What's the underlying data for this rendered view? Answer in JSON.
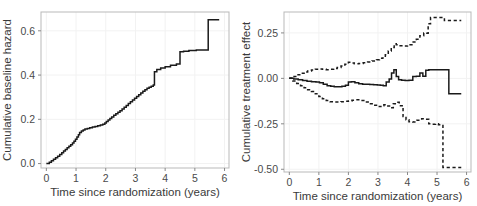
{
  "figure": {
    "panels": [
      "baseline-hazard",
      "treatment-effect"
    ],
    "line_color": "#1a1a1a",
    "grid_color": "#f2f2f2",
    "border_color": "#b9b9b9"
  },
  "chart_data": [
    {
      "type": "line",
      "id": "baseline-hazard",
      "title": "",
      "xlabel": "Time since randomization (years)",
      "ylabel": "Cumulative baseline hazard",
      "xlim": [
        -0.18,
        6.15
      ],
      "ylim": [
        -0.02,
        0.685
      ],
      "xticks": [
        0,
        1,
        2,
        3,
        4,
        5,
        6
      ],
      "xticklabels": [
        "0",
        "1",
        "2",
        "3",
        "4",
        "5",
        "6"
      ],
      "yticks": [
        0.0,
        0.2,
        0.4,
        0.6
      ],
      "yticklabels": [
        "0.0",
        "0.2",
        "0.4",
        "0.6"
      ],
      "grid": true,
      "legend": "none",
      "series": [
        {
          "name": "cumulative baseline hazard",
          "style": "step-solid",
          "x": [
            0.0,
            0.1,
            0.17,
            0.24,
            0.31,
            0.38,
            0.45,
            0.52,
            0.58,
            0.64,
            0.7,
            0.76,
            0.82,
            0.88,
            0.93,
            0.98,
            1.03,
            1.08,
            1.12,
            1.18,
            1.24,
            1.3,
            1.38,
            1.46,
            1.55,
            1.64,
            1.73,
            1.82,
            1.9,
            1.97,
            2.02,
            2.08,
            2.14,
            2.2,
            2.27,
            2.34,
            2.41,
            2.48,
            2.55,
            2.62,
            2.69,
            2.76,
            2.83,
            2.9,
            2.97,
            3.04,
            3.11,
            3.18,
            3.25,
            3.32,
            3.39,
            3.46,
            3.53,
            3.6,
            3.64,
            3.72,
            3.85,
            4.0,
            4.18,
            4.38,
            4.5,
            4.62,
            4.8,
            5.05,
            5.45,
            5.82
          ],
          "y": [
            0.0,
            0.006,
            0.013,
            0.019,
            0.026,
            0.033,
            0.041,
            0.049,
            0.057,
            0.064,
            0.071,
            0.078,
            0.085,
            0.093,
            0.101,
            0.11,
            0.12,
            0.13,
            0.14,
            0.147,
            0.152,
            0.156,
            0.159,
            0.162,
            0.165,
            0.168,
            0.171,
            0.174,
            0.178,
            0.183,
            0.19,
            0.197,
            0.204,
            0.211,
            0.218,
            0.225,
            0.232,
            0.239,
            0.247,
            0.255,
            0.263,
            0.271,
            0.279,
            0.287,
            0.295,
            0.303,
            0.311,
            0.319,
            0.327,
            0.334,
            0.34,
            0.345,
            0.35,
            0.355,
            0.415,
            0.425,
            0.432,
            0.438,
            0.444,
            0.45,
            0.505,
            0.508,
            0.511,
            0.513,
            0.65,
            0.65
          ]
        }
      ]
    },
    {
      "type": "line",
      "id": "treatment-effect",
      "title": "",
      "xlabel": "Time since randomization (years)",
      "ylabel": "Cumulative treatment effect",
      "xlim": [
        -0.18,
        6.15
      ],
      "ylim": [
        -0.515,
        0.365
      ],
      "xticks": [
        0,
        1,
        2,
        3,
        4,
        5,
        6
      ],
      "xticklabels": [
        "0",
        "1",
        "2",
        "3",
        "4",
        "5",
        "6"
      ],
      "yticks": [
        0.25,
        0.0,
        -0.25,
        -0.5
      ],
      "yticklabels": [
        "0.25",
        "0.00",
        "-0.25",
        "-0.50"
      ],
      "grid": true,
      "legend": "none",
      "series": [
        {
          "name": "upper confidence limit",
          "style": "step-dashed",
          "x": [
            0.0,
            0.12,
            0.25,
            0.38,
            0.5,
            0.62,
            0.75,
            0.88,
            1.0,
            1.12,
            1.25,
            1.38,
            1.5,
            1.62,
            1.75,
            1.88,
            2.0,
            2.1,
            2.2,
            2.35,
            2.5,
            2.65,
            2.8,
            2.95,
            3.05,
            3.15,
            3.25,
            3.35,
            3.45,
            3.55,
            3.62,
            3.7,
            3.85,
            4.0,
            4.15,
            4.3,
            4.42,
            4.55,
            4.62,
            4.7,
            4.78,
            4.9,
            5.05,
            5.25,
            5.5,
            5.82
          ],
          "y": [
            0.0,
            0.01,
            0.02,
            0.028,
            0.035,
            0.04,
            0.046,
            0.05,
            0.052,
            0.05,
            0.048,
            0.05,
            0.054,
            0.06,
            0.068,
            0.078,
            0.088,
            0.085,
            0.08,
            0.082,
            0.086,
            0.09,
            0.096,
            0.103,
            0.11,
            0.112,
            0.13,
            0.15,
            0.17,
            0.19,
            0.185,
            0.18,
            0.178,
            0.185,
            0.2,
            0.215,
            0.235,
            0.25,
            0.248,
            0.3,
            0.335,
            0.335,
            0.335,
            0.318,
            0.318,
            0.318
          ]
        },
        {
          "name": "cumulative treatment effect",
          "style": "step-solid",
          "x": [
            0.0,
            0.15,
            0.3,
            0.45,
            0.6,
            0.75,
            0.9,
            1.02,
            1.15,
            1.28,
            1.4,
            1.52,
            1.65,
            1.78,
            1.9,
            2.0,
            2.1,
            2.22,
            2.35,
            2.48,
            2.6,
            2.72,
            2.85,
            2.98,
            3.08,
            3.18,
            3.28,
            3.38,
            3.46,
            3.54,
            3.62,
            3.7,
            3.8,
            3.92,
            4.05,
            4.18,
            4.3,
            4.42,
            4.52,
            4.62,
            4.72,
            4.85,
            5.05,
            5.4,
            5.82
          ],
          "y": [
            0.0,
            -0.004,
            -0.008,
            -0.012,
            -0.016,
            -0.018,
            -0.02,
            -0.024,
            -0.032,
            -0.04,
            -0.044,
            -0.046,
            -0.046,
            -0.044,
            -0.038,
            -0.02,
            -0.018,
            -0.024,
            -0.03,
            -0.032,
            -0.033,
            -0.034,
            -0.035,
            -0.036,
            -0.038,
            -0.04,
            -0.02,
            -0.004,
            0.03,
            0.048,
            0.01,
            -0.008,
            -0.01,
            -0.012,
            -0.01,
            0.01,
            0.012,
            0.03,
            0.012,
            0.045,
            0.048,
            0.048,
            0.048,
            -0.085,
            -0.085
          ]
        },
        {
          "name": "lower confidence limit",
          "style": "step-dashed",
          "x": [
            0.0,
            0.12,
            0.25,
            0.38,
            0.5,
            0.62,
            0.75,
            0.88,
            1.0,
            1.12,
            1.25,
            1.38,
            1.5,
            1.62,
            1.75,
            1.88,
            2.0,
            2.12,
            2.25,
            2.4,
            2.55,
            2.7,
            2.85,
            3.0,
            3.1,
            3.2,
            3.3,
            3.42,
            3.52,
            3.62,
            3.72,
            3.85,
            3.95,
            4.05,
            4.18,
            4.32,
            4.48,
            4.6,
            4.72,
            4.85,
            4.95,
            5.05,
            5.2,
            5.45,
            5.82
          ],
          "y": [
            0.0,
            -0.015,
            -0.028,
            -0.04,
            -0.052,
            -0.062,
            -0.072,
            -0.085,
            -0.1,
            -0.112,
            -0.122,
            -0.128,
            -0.13,
            -0.13,
            -0.128,
            -0.126,
            -0.124,
            -0.12,
            -0.118,
            -0.122,
            -0.13,
            -0.14,
            -0.148,
            -0.155,
            -0.15,
            -0.145,
            -0.152,
            -0.162,
            -0.14,
            -0.132,
            -0.15,
            -0.21,
            -0.228,
            -0.238,
            -0.24,
            -0.23,
            -0.222,
            -0.225,
            -0.25,
            -0.252,
            -0.25,
            -0.255,
            -0.49,
            -0.49,
            -0.49
          ]
        }
      ]
    }
  ]
}
